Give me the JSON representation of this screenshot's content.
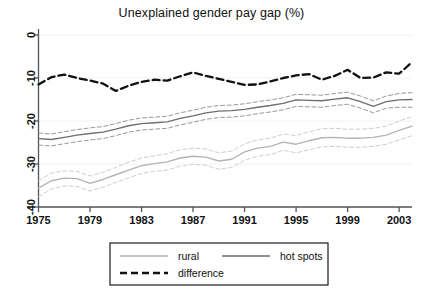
{
  "chart_data": {
    "type": "line",
    "title": "Unexplained gender pay gap (%)",
    "xlabel": "",
    "ylabel": "",
    "xlim": [
      1975,
      2004
    ],
    "ylim": [
      -40,
      0
    ],
    "xticks": [
      1975,
      1979,
      1983,
      1987,
      1991,
      1995,
      1999,
      2003
    ],
    "yticks": [
      0,
      -10,
      -20,
      -30,
      -40
    ],
    "grid": false,
    "legend_position": "bottom",
    "colors": {
      "rural": "#b4b4b4",
      "hot_spots": "#6e6e6e",
      "difference": "#111111",
      "axis": "#555555",
      "background": "#ffffff"
    },
    "x": [
      1975,
      1976,
      1977,
      1978,
      1979,
      1980,
      1981,
      1982,
      1983,
      1984,
      1985,
      1986,
      1987,
      1988,
      1989,
      1990,
      1991,
      1992,
      1993,
      1994,
      1995,
      1996,
      1997,
      1998,
      1999,
      2000,
      2001,
      2002,
      2003,
      2004
    ],
    "series": [
      {
        "name": "rural",
        "style": "solid",
        "color": "#b4b4b4",
        "values": [
          -35.6,
          -33.9,
          -33.3,
          -33.4,
          -34.5,
          -33.6,
          -32.5,
          -31.4,
          -30.4,
          -29.9,
          -29.5,
          -28.6,
          -28.2,
          -28.4,
          -29.3,
          -28.9,
          -27.2,
          -26.3,
          -25.9,
          -24.9,
          -25.4,
          -24.6,
          -23.9,
          -23.8,
          -24.0,
          -24.0,
          -23.8,
          -23.3,
          -22.2,
          -21.2
        ]
      },
      {
        "name": "rural_upper_ci",
        "style": "dashed",
        "color": "#c8c8c8",
        "values": [
          -33.9,
          -32.1,
          -31.6,
          -31.7,
          -32.8,
          -31.9,
          -30.8,
          -29.6,
          -28.6,
          -28.1,
          -27.6,
          -26.7,
          -26.3,
          -26.5,
          -27.4,
          -27.0,
          -25.3,
          -24.4,
          -24.0,
          -23.0,
          -23.4,
          -22.5,
          -21.8,
          -21.7,
          -21.9,
          -21.9,
          -21.7,
          -21.2,
          -20.0,
          -19.0
        ]
      },
      {
        "name": "rural_lower_ci",
        "style": "dashed",
        "color": "#c8c8c8",
        "values": [
          -37.6,
          -35.8,
          -35.1,
          -35.2,
          -36.3,
          -35.4,
          -34.3,
          -33.2,
          -32.2,
          -31.7,
          -31.4,
          -30.5,
          -30.1,
          -30.3,
          -31.2,
          -30.8,
          -29.1,
          -28.2,
          -27.8,
          -26.8,
          -27.4,
          -26.7,
          -26.0,
          -25.9,
          -26.1,
          -26.1,
          -25.9,
          -25.4,
          -24.4,
          -23.4
        ]
      },
      {
        "name": "hot spots",
        "style": "solid",
        "color": "#6e6e6e",
        "values": [
          -24.1,
          -24.3,
          -23.8,
          -23.3,
          -22.9,
          -22.6,
          -21.9,
          -21.1,
          -20.6,
          -20.4,
          -20.2,
          -19.4,
          -18.8,
          -18.1,
          -17.7,
          -17.6,
          -17.3,
          -16.8,
          -16.4,
          -15.9,
          -15.1,
          -15.2,
          -15.3,
          -14.9,
          -14.6,
          -15.5,
          -16.6,
          -15.5,
          -15.1,
          -15.0
        ]
      },
      {
        "name": "hot_spots_upper_ci",
        "style": "dashed",
        "color": "#8c8c8c",
        "values": [
          -22.8,
          -23.0,
          -22.5,
          -22.0,
          -21.6,
          -21.3,
          -20.6,
          -19.8,
          -19.3,
          -19.1,
          -18.9,
          -18.1,
          -17.5,
          -16.8,
          -16.4,
          -16.3,
          -16.0,
          -15.5,
          -15.1,
          -14.6,
          -13.8,
          -13.9,
          -14.0,
          -13.6,
          -13.3,
          -14.2,
          -15.3,
          -14.2,
          -13.6,
          -13.4
        ]
      },
      {
        "name": "hot_spots_lower_ci",
        "style": "dashed",
        "color": "#8c8c8c",
        "values": [
          -25.6,
          -25.8,
          -25.3,
          -24.8,
          -24.4,
          -24.1,
          -23.4,
          -22.6,
          -22.1,
          -21.9,
          -21.7,
          -20.9,
          -20.3,
          -19.6,
          -19.2,
          -19.1,
          -18.8,
          -18.3,
          -17.9,
          -17.4,
          -16.6,
          -16.7,
          -16.8,
          -16.4,
          -16.1,
          -17.0,
          -18.1,
          -17.0,
          -16.8,
          -16.8
        ]
      },
      {
        "name": "difference",
        "style": "dashed",
        "color": "#111111",
        "values": [
          -11.5,
          -9.8,
          -9.2,
          -10.0,
          -10.6,
          -11.3,
          -13.0,
          -11.8,
          -10.9,
          -10.4,
          -10.6,
          -9.6,
          -8.7,
          -9.5,
          -10.2,
          -10.9,
          -11.6,
          -11.5,
          -10.8,
          -10.0,
          -9.4,
          -9.1,
          -10.4,
          -9.5,
          -8.1,
          -10.0,
          -9.9,
          -8.7,
          -9.0,
          -6.3
        ]
      }
    ],
    "legend": [
      {
        "label": "rural",
        "style": "solid",
        "color": "#b4b4b4"
      },
      {
        "label": "hot spots",
        "style": "solid",
        "color": "#6e6e6e"
      },
      {
        "label": "difference",
        "style": "dashed",
        "color": "#111111"
      }
    ]
  }
}
